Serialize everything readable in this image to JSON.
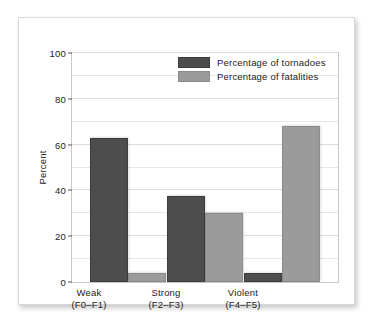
{
  "chart_data": {
    "type": "bar",
    "title": "",
    "xlabel": "",
    "ylabel": "Percent",
    "ylim": [
      0,
      100
    ],
    "yticks": [
      0,
      20,
      40,
      60,
      80,
      100
    ],
    "ytick_labels": [
      "0",
      "20",
      "40",
      "60",
      "80",
      "100"
    ],
    "grid": true,
    "legend_position": "top-center",
    "categories": [
      "Weak",
      "Strong",
      "Violent"
    ],
    "category_sublabels": [
      "(F0–F1)",
      "(F2–F3)",
      "(F4–F5)"
    ],
    "series": [
      {
        "name": "Percentage of tornadoes",
        "color": "#4d4d4d",
        "values": [
          63,
          37.5,
          4
        ]
      },
      {
        "name": "Percentage of fatalities",
        "color": "#9b9b9b",
        "values": [
          4,
          30,
          68
        ]
      }
    ]
  },
  "axis": {
    "y_label": "Percent",
    "y_ticks": [
      "100",
      "80",
      "60",
      "40",
      "20",
      "0"
    ],
    "x_groups": [
      {
        "name": "Weak",
        "sub": "(F0–F1)"
      },
      {
        "name": "Strong",
        "sub": "(F2–F3)"
      },
      {
        "name": "Violent",
        "sub": "(F4–F5)"
      }
    ]
  },
  "legend": {
    "items": [
      {
        "label": "Percentage of tornadoes",
        "swatch": "dark-swatch"
      },
      {
        "label": "Percentage of fatalities",
        "swatch": "light-swatch"
      }
    ]
  },
  "colors": {
    "series_dark": "#4d4d4d",
    "series_light": "#9b9b9b",
    "grid": "#e6e6e6",
    "frame": "#c9c9c9",
    "text": "#1b1b1b"
  }
}
